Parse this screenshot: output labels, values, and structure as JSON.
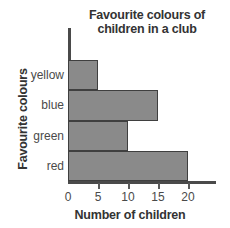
{
  "chart_data": {
    "type": "bar",
    "orientation": "horizontal",
    "title": "Favourite colours of children in a club",
    "title_lines": [
      "Favourite colours of",
      "children in a club"
    ],
    "xlabel": "Number of children",
    "ylabel": "Favourite colours",
    "categories": [
      "yellow",
      "blue",
      "green",
      "red"
    ],
    "values": [
      5,
      15,
      10,
      20
    ],
    "xticks": [
      0,
      5,
      10,
      15,
      20
    ],
    "xtick_labels": [
      "0",
      "5",
      "10",
      "15",
      "20"
    ],
    "xlim": [
      0,
      24
    ],
    "grid": false,
    "legend": false,
    "bar_color": "#8a8a8a",
    "bar_edge_color": "#3f3f3f",
    "axis_color": "#4a4a4a",
    "background": "#ffffff",
    "bars": [
      {
        "category": "yellow",
        "value": 5
      },
      {
        "category": "blue",
        "value": 15
      },
      {
        "category": "green",
        "value": 10
      },
      {
        "category": "red",
        "value": 20
      }
    ]
  }
}
